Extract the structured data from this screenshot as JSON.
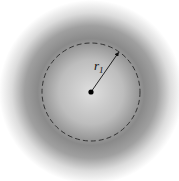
{
  "diagram": {
    "type": "radial-density-field",
    "label": {
      "main": "r",
      "subscript": "1"
    },
    "center": {
      "x": 91,
      "y": 92
    },
    "circle_radius_px": 49,
    "arrow_end": {
      "x": 119,
      "y": 52
    },
    "colors": {
      "background": "#ffffff",
      "center_shade": "#d8d8d8",
      "ring_shade": "#7a7a7a",
      "dashed_circle": "#333333",
      "radius_line": "#111111"
    }
  }
}
